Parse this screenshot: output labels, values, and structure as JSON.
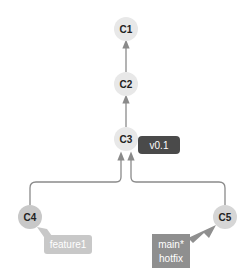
{
  "diagram": {
    "type": "git-commit-graph",
    "commits": [
      {
        "id": "C1",
        "cx": 126,
        "cy": 29,
        "r": 12,
        "fill": "#e8e8e8"
      },
      {
        "id": "C2",
        "cx": 126,
        "cy": 84,
        "r": 12,
        "fill": "#e8e8e8"
      },
      {
        "id": "C3",
        "cx": 126,
        "cy": 139,
        "r": 12,
        "fill": "#e8e8e8"
      },
      {
        "id": "C4",
        "cx": 30,
        "cy": 217,
        "r": 12,
        "fill": "#c8c8c8"
      },
      {
        "id": "C5",
        "cx": 225,
        "cy": 217,
        "r": 12,
        "fill": "#d6d6d6"
      }
    ],
    "edges": [
      {
        "from": "C2",
        "to": "C1"
      },
      {
        "from": "C3",
        "to": "C2"
      },
      {
        "from": "C4",
        "to": "C3"
      },
      {
        "from": "C5",
        "to": "C3"
      }
    ],
    "refs": [
      {
        "name": "v0.1",
        "kind": "tag",
        "points_to": "C3",
        "fill": "#4a4a4a",
        "text_color": "#ffffff"
      },
      {
        "name": "feature1",
        "kind": "branch",
        "points_to": "C4",
        "fill": "#c8c8c8",
        "text_color": "#ffffff"
      },
      {
        "name": "main*",
        "kind": "branch",
        "points_to": "C5",
        "fill": "#8f8f8f",
        "text_color": "#ffffff",
        "second_line": "hotfix"
      }
    ]
  },
  "labels": {
    "c1": "C1",
    "c2": "C2",
    "c3": "C3",
    "c4": "C4",
    "c5": "C5",
    "tag_v01": "v0.1",
    "branch_feature1": "feature1",
    "branch_main": "main*",
    "branch_hotfix": "hotfix"
  },
  "colors": {
    "edge": "#8a8a8a",
    "node_light": "#e8e8e8",
    "node_c4": "#c8c8c8",
    "node_c5": "#d6d6d6",
    "tag": "#4a4a4a",
    "feature_label": "#c8c8c8",
    "main_label": "#8f8f8f"
  }
}
